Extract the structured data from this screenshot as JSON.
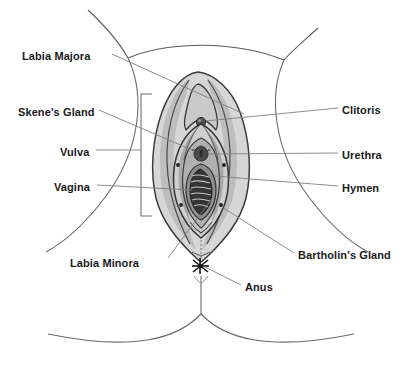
{
  "diagram": {
    "type": "anatomical-illustration",
    "colors": {
      "background": "#ffffff",
      "outline": "#4a4a4a",
      "leader_line": "#777777",
      "label_text": "#1a1a1a",
      "shade_light": "#dcdcdc",
      "shade_mid": "#b4b4b4",
      "shade_dark": "#8a8a8a",
      "shade_darkest": "#4f4f4f",
      "inner_dark": "#3a3a3a"
    },
    "labels": [
      {
        "id": "labia-majora",
        "text": "Labia Majora",
        "side": "left",
        "x": 22,
        "y": 50
      },
      {
        "id": "skenes-gland",
        "text": "Skene's Gland",
        "side": "left",
        "x": 18,
        "y": 106
      },
      {
        "id": "vulva",
        "text": "Vulva",
        "side": "left",
        "x": 60,
        "y": 146
      },
      {
        "id": "vagina",
        "text": "Vagina",
        "side": "left",
        "x": 54,
        "y": 181
      },
      {
        "id": "labia-minora",
        "text": "Labia Minora",
        "side": "left",
        "x": 70,
        "y": 257
      },
      {
        "id": "clitoris",
        "text": "Clitoris",
        "side": "right",
        "x": 342,
        "y": 104
      },
      {
        "id": "urethra",
        "text": "Urethra",
        "side": "right",
        "x": 342,
        "y": 149
      },
      {
        "id": "hymen",
        "text": "Hymen",
        "side": "right",
        "x": 342,
        "y": 182
      },
      {
        "id": "bartholins-gland",
        "text": "Bartholin's Gland",
        "side": "right",
        "x": 298,
        "y": 249
      },
      {
        "id": "anus",
        "text": "Anus",
        "side": "right",
        "x": 245,
        "y": 281
      }
    ],
    "bracket": {
      "id": "vulva-extent-bracket",
      "x": 141,
      "top": 94,
      "bottom": 216,
      "arm": 11
    },
    "markers": {
      "bartholin_gland_dots": [
        {
          "x": 178,
          "y": 165
        },
        {
          "x": 219,
          "y": 165
        },
        {
          "x": 181,
          "y": 205
        },
        {
          "x": 217,
          "y": 205
        }
      ],
      "anus": {
        "x": 200,
        "y": 265
      }
    }
  }
}
